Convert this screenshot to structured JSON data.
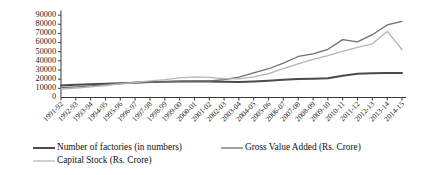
{
  "chart_data": {
    "type": "line",
    "title": "",
    "xlabel": "",
    "ylabel": "",
    "ylim": [
      0,
      95000
    ],
    "yticks": [
      10000,
      20000,
      30000,
      40000,
      50000,
      60000,
      70000,
      80000,
      90000
    ],
    "grid": false,
    "legend_position": "bottom-left",
    "categories": [
      "1991-92",
      "1992-93",
      "1993-94",
      "1994-95",
      "1995-96",
      "1996-97",
      "1997-98",
      "1998-99",
      "1999-00",
      "2000-01",
      "2001-02",
      "2002-03",
      "2003-04",
      "2004-05",
      "2005-06",
      "2006-07",
      "2007-08",
      "2008-09",
      "2009-10",
      "2010-11",
      "2011-12",
      "2012-13",
      "2013-14",
      "2014-15"
    ],
    "series": [
      {
        "name": "Number of factories (in numbers)",
        "color": "#4a4a4a",
        "width": 2.0,
        "values": [
          13200,
          13900,
          14400,
          15000,
          15600,
          16200,
          16800,
          17100,
          17400,
          17600,
          17500,
          17200,
          17000,
          17600,
          18400,
          19300,
          20200,
          20600,
          21000,
          23700,
          25900,
          26400,
          26700,
          26800
        ]
      },
      {
        "name": "Gross Value Added (Rs. Crore)",
        "color": "#6e6e6e",
        "width": 1.3,
        "values": [
          10800,
          11600,
          12600,
          13900,
          15400,
          16600,
          17200,
          17000,
          17800,
          18200,
          18000,
          19600,
          22200,
          26800,
          31400,
          37600,
          44800,
          47600,
          52600,
          63200,
          60800,
          68600,
          79200,
          83200
        ]
      },
      {
        "name": "Capital Stock (Rs. Crore)",
        "color": "#b5b5b5",
        "width": 1.3,
        "values": [
          9200,
          10300,
          11600,
          13100,
          14800,
          16400,
          18200,
          19600,
          21400,
          22600,
          21900,
          20600,
          20400,
          22600,
          26200,
          31600,
          36800,
          41600,
          45600,
          50400,
          54800,
          58600,
          72200,
          52400
        ]
      }
    ]
  },
  "legend": {
    "items": [
      {
        "label": "Number of factories (in numbers)"
      },
      {
        "label": "Gross Value Added (Rs. Crore)"
      },
      {
        "label": "Capital Stock (Rs. Crore)"
      }
    ]
  }
}
